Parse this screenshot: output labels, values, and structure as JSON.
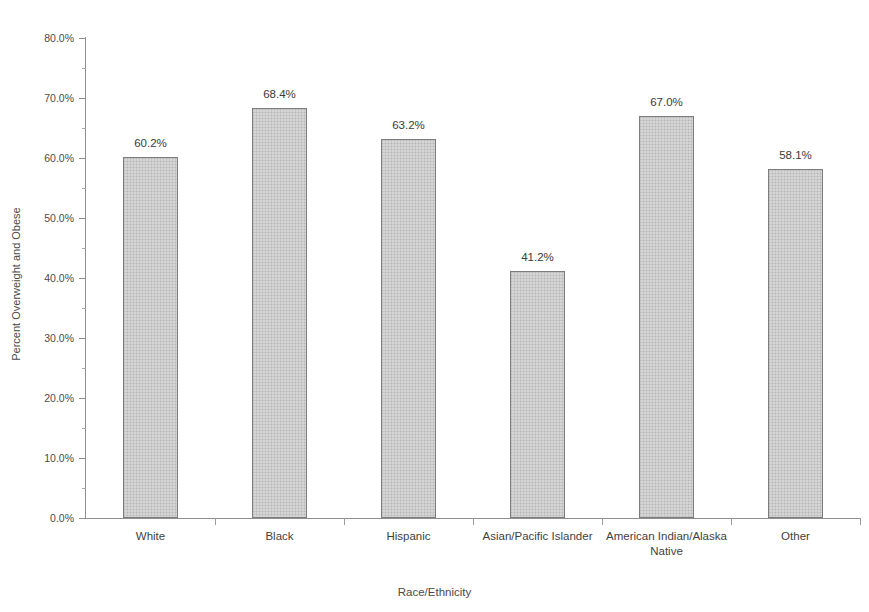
{
  "chart_data": {
    "type": "bar",
    "title": "",
    "title_note": "title is cropped off the top edge of the screenshot",
    "xlabel": "Race/Ethnicity",
    "ylabel": "Percent Overweight and Obese",
    "categories": [
      "White",
      "Black",
      "Hispanic",
      "Asian/Pacific Islander",
      "American Indian/Alaska Native",
      "Other"
    ],
    "values": [
      60.2,
      68.4,
      63.2,
      41.2,
      67.0,
      58.1
    ],
    "value_labels": [
      "60.2%",
      "68.4%",
      "63.2%",
      "41.2%",
      "67.0%",
      "58.1%"
    ],
    "ylim": [
      0,
      80
    ],
    "ytick_values": [
      0,
      10,
      20,
      30,
      40,
      50,
      60,
      70,
      80
    ],
    "ytick_labels": [
      "0.0%",
      "10.0%",
      "20.0%",
      "30.0%",
      "40.0%",
      "50.0%",
      "60.0%",
      "70.0%",
      "80.0%"
    ],
    "minor_tick_interval": 5,
    "grid": false,
    "legend": null,
    "bar_fill_color": "#c9c9c9",
    "bar_border_color": "#7d7d7d",
    "axis_color": "#8e8e8e",
    "text_color": "#3f3f3f"
  }
}
